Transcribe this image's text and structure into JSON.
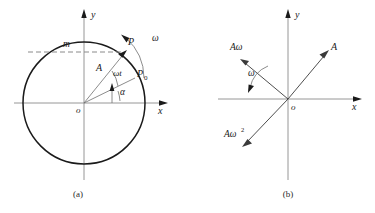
{
  "figure": {
    "background_color": "#ffffff",
    "line_color": "#1a1a1a",
    "axis_color": "#8a8a8a",
    "panels": [
      {
        "id": "a",
        "caption": "(a)",
        "axis_x_label": "x",
        "axis_y_label": "y",
        "origin_label": "o",
        "labels": {
          "mass": "m",
          "point_p": "P",
          "point_p0": "P",
          "point_p0_sub": "0",
          "amplitude": "A",
          "phase": "ωt",
          "initial_phase": "α",
          "angular_velocity": "ω"
        }
      },
      {
        "id": "b",
        "caption": "(b)",
        "axis_x_label": "x",
        "axis_y_label": "y",
        "origin_label": "o",
        "labels": {
          "displacement": "A",
          "velocity": "Aω",
          "acceleration_base": "Aω",
          "acceleration_exp": "2",
          "angular_velocity": "ω"
        }
      }
    ]
  }
}
